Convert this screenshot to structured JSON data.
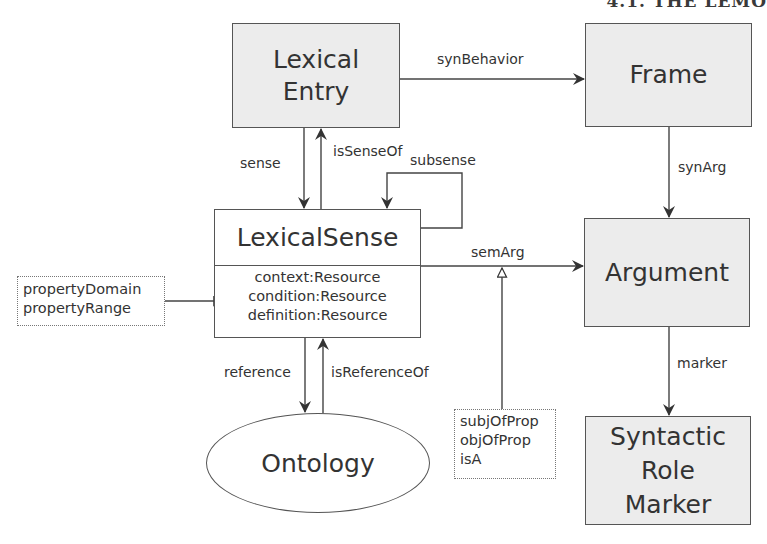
{
  "header": {
    "cut_text": "4.1. THE LEMO"
  },
  "nodes": {
    "lexical_entry": {
      "lines": [
        "Lexical",
        "Entry"
      ]
    },
    "frame": {
      "label": "Frame"
    },
    "lexical_sense": {
      "title": "LexicalSense",
      "attributes": [
        "context:Resource",
        "condition:Resource",
        "definition:Resource"
      ]
    },
    "argument": {
      "label": "Argument"
    },
    "syntactic_role_marker": {
      "lines": [
        "Syntactic",
        "Role",
        "Marker"
      ]
    },
    "ontology": {
      "label": "Ontology"
    }
  },
  "notes": {
    "property_note": {
      "lines": [
        "propertyDomain",
        "propertyRange"
      ]
    },
    "semarg_note": {
      "lines": [
        "subjOfProp",
        "objOfProp",
        "isA"
      ]
    }
  },
  "edges": {
    "synBehavior": "synBehavior",
    "sense": "sense",
    "isSenseOf": "isSenseOf",
    "subsense": "subsense",
    "synArg": "synArg",
    "semArg": "semArg",
    "marker": "marker",
    "reference": "reference",
    "isReferenceOf": "isReferenceOf"
  },
  "colors": {
    "node_fill": "#ececec",
    "stroke": "#555555",
    "text": "#333333"
  }
}
